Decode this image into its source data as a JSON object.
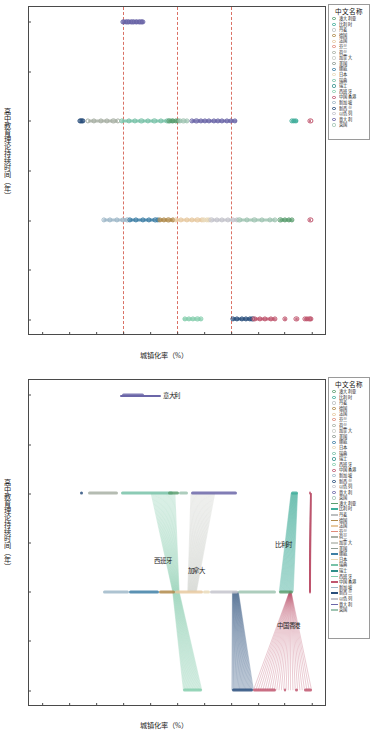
{
  "figure": {
    "caption": ""
  },
  "axes": {
    "xlabel": "城镇化率（%）",
    "ylabel": "高中教育理论持续时间（年）",
    "xticks": [
      "50.0",
      "55.0",
      "60.0",
      "65.0",
      "70.0",
      "75.0",
      "80.0",
      "85.0",
      "90.0",
      "95.0",
      "100.0"
    ],
    "yticks": [
      "2.0",
      "2.5",
      "3.0",
      "3.5",
      "4.0",
      "4.5",
      "5.0"
    ],
    "xlim": [
      47.5,
      102.5
    ],
    "ylim": [
      1.85,
      5.15
    ],
    "reference_lines_x": [
      65.0,
      75.0,
      85.0
    ],
    "reference_line_color": "#d4594b"
  },
  "legend": {
    "title": "中文名称",
    "countries": [
      {
        "label": "澳大利亚",
        "color": "#5a9e6f"
      },
      {
        "label": "比利时",
        "color": "#3fae9b"
      },
      {
        "label": "丹麦",
        "color": "#bcbfc1"
      },
      {
        "label": "德国",
        "color": "#b08a4a"
      },
      {
        "label": "法国",
        "color": "#e7c9a0"
      },
      {
        "label": "芬兰",
        "color": "#e08b7a"
      },
      {
        "label": "荷兰",
        "color": "#a8b0a4"
      },
      {
        "label": "加拿大",
        "color": "#c9ccc6"
      },
      {
        "label": "美国",
        "color": "#8f9b93"
      },
      {
        "label": "挪威",
        "color": "#3e7fa6"
      },
      {
        "label": "日本",
        "color": "#e9d9b8"
      },
      {
        "label": "瑞典",
        "color": "#78c2a8"
      },
      {
        "label": "瑞士",
        "color": "#2f8f8a"
      },
      {
        "label": "西班牙",
        "color": "#86cfae"
      },
      {
        "label": "中国香港",
        "color": "#c0566e"
      },
      {
        "label": "新加坡",
        "color": "#9fb8c9"
      },
      {
        "label": "新西兰",
        "color": "#2a4f7c"
      },
      {
        "label": "以色列",
        "color": "#c4c4cc"
      },
      {
        "label": "意大利",
        "color": "#6b66a8"
      },
      {
        "label": "英国",
        "color": "#9fc4b2"
      }
    ]
  },
  "chart_top": {
    "type": "scatter",
    "title": "",
    "series": [
      {
        "name": "意大利",
        "color": "#6b66a8",
        "y": 5.0,
        "x_start": 64.8,
        "x_end": 68.8,
        "points": [
          64.9,
          65.2,
          65.5,
          65.8,
          66.1,
          66.4,
          66.7,
          67.0,
          67.3,
          67.6,
          67.9,
          68.2,
          68.5,
          68.7
        ]
      },
      {
        "name": "新西兰",
        "color": "#2a4f7c",
        "y": 4.0,
        "x_start": 56.9,
        "x_end": 57.6,
        "points": [
          56.9,
          57.1,
          57.3,
          57.5
        ]
      },
      {
        "name": "荷兰",
        "color": "#a8b0a4",
        "y": 4.0,
        "x_start": 58.4,
        "x_end": 64.0,
        "points": [
          58.5,
          59.6,
          60.8,
          62.0,
          63.2,
          64.0
        ]
      },
      {
        "name": "瑞典",
        "color": "#78c2a8",
        "y": 4.0,
        "x_start": 64.6,
        "x_end": 74.2,
        "points": [
          64.8,
          66.0,
          67.2,
          68.4,
          69.6,
          70.8,
          72.0,
          73.2,
          74.0
        ]
      },
      {
        "name": "澳大利亚",
        "color": "#5a9e6f",
        "y": 4.0,
        "x_start": 73.4,
        "x_end": 75.4,
        "points": [
          73.6,
          74.2,
          74.8,
          75.2
        ]
      },
      {
        "name": "英国",
        "color": "#9fc4b2",
        "y": 4.0,
        "x_start": 75.4,
        "x_end": 77.0,
        "points": [
          75.6,
          76.2,
          76.8
        ]
      },
      {
        "name": "意大利",
        "color": "#6b66a8",
        "y": 4.0,
        "x_start": 77.6,
        "x_end": 86.2,
        "points": [
          77.8,
          78.6,
          79.4,
          80.2,
          81.0,
          81.8,
          82.6,
          83.4,
          84.2,
          85.0,
          85.8
        ]
      },
      {
        "name": "比利时",
        "color": "#3fae9b",
        "y": 4.0,
        "x_start": 96.2,
        "x_end": 97.4,
        "points": [
          96.3,
          96.7,
          97.1
        ]
      },
      {
        "name": "中国香港",
        "color": "#c0566e",
        "y": 4.0,
        "x_start": 99.6,
        "x_end": 99.9,
        "points": [
          99.8
        ]
      },
      {
        "name": "新加坡",
        "color": "#9fb8c9",
        "y": 3.0,
        "x_start": 61.2,
        "x_end": 66.0,
        "points": [
          61.4,
          62.6,
          63.8,
          65.0,
          65.8
        ]
      },
      {
        "name": "挪威",
        "color": "#3e7fa6",
        "y": 3.0,
        "x_start": 66.0,
        "x_end": 71.6,
        "points": [
          66.2,
          67.4,
          68.6,
          69.8,
          71.0,
          71.4
        ]
      },
      {
        "name": "德国",
        "color": "#b08a4a",
        "y": 3.0,
        "x_start": 71.6,
        "x_end": 74.6,
        "points": [
          71.8,
          72.6,
          73.4,
          74.2
        ]
      },
      {
        "name": "法国",
        "color": "#e7c9a0",
        "y": 3.0,
        "x_start": 74.6,
        "x_end": 79.8,
        "points": [
          74.8,
          75.8,
          76.8,
          77.8,
          78.8,
          79.6
        ]
      },
      {
        "name": "日本",
        "color": "#e9d9b8",
        "y": 3.0,
        "x_start": 79.8,
        "x_end": 81.2,
        "points": [
          80.0,
          80.6,
          81.0
        ]
      },
      {
        "name": "以色列",
        "color": "#c4c4cc",
        "y": 3.0,
        "x_start": 81.2,
        "x_end": 86.4,
        "points": [
          81.4,
          82.4,
          83.4,
          84.4,
          85.4,
          86.2
        ]
      },
      {
        "name": "英国",
        "color": "#9fc4b2",
        "y": 3.0,
        "x_start": 86.4,
        "x_end": 93.4,
        "points": [
          86.6,
          88.0,
          89.4,
          90.8,
          92.2,
          93.2
        ]
      },
      {
        "name": "澳大利亚",
        "color": "#5a9e6f",
        "y": 3.0,
        "x_start": 94.0,
        "x_end": 96.6,
        "points": [
          94.2,
          95.0,
          95.8,
          96.4
        ]
      },
      {
        "name": "中国香港",
        "color": "#c0566e",
        "y": 3.0,
        "x_start": 99.5,
        "x_end": 99.9,
        "points": [
          99.8
        ]
      },
      {
        "name": "西班牙",
        "color": "#86cfae",
        "y": 2.0,
        "x_start": 76.2,
        "x_end": 79.6,
        "points": [
          76.4,
          77.2,
          78.0,
          78.8,
          79.4
        ]
      },
      {
        "name": "新西兰",
        "color": "#2a4f7c",
        "y": 2.0,
        "x_start": 85.2,
        "x_end": 89.2,
        "points": [
          85.4,
          86.2,
          87.0,
          87.8,
          88.6,
          89.0
        ]
      },
      {
        "name": "中国香港",
        "color": "#c0566e",
        "y": 2.0,
        "x_start": 89.2,
        "x_end": 93.4,
        "points": [
          89.4,
          90.4,
          91.4,
          92.4,
          93.2
        ]
      },
      {
        "name": "中国香港",
        "color": "#c0566e",
        "y": 2.0,
        "x_start": 94.8,
        "x_end": 95.2,
        "points": [
          95.0
        ]
      },
      {
        "name": "中国香港",
        "color": "#c0566e",
        "y": 2.0,
        "x_start": 97.0,
        "x_end": 97.4,
        "points": [
          97.2
        ]
      },
      {
        "name": "中国香港",
        "color": "#c0566e",
        "y": 2.0,
        "x_start": 98.6,
        "x_end": 100.0,
        "points": [
          98.8,
          99.2,
          99.6,
          99.9
        ]
      }
    ]
  },
  "chart_bottom": {
    "type": "line",
    "title": "",
    "annotations": [
      {
        "label": "意大利",
        "x": 72.0,
        "y": 5.0,
        "color": "#6b66a8",
        "swatch": true
      },
      {
        "label": "西班牙",
        "x": 70.4,
        "y": 3.32,
        "color": "#86cfae",
        "swatch": false
      },
      {
        "label": "加拿大",
        "x": 76.6,
        "y": 3.22,
        "color": "#c9ccc6",
        "swatch": false
      },
      {
        "label": "比利时",
        "x": 92.8,
        "y": 3.48,
        "color": "#3fae9b",
        "swatch": false
      },
      {
        "label": "中国香港",
        "x": 93.2,
        "y": 2.66,
        "color": "#c0566e",
        "swatch": false
      }
    ],
    "flows": [
      {
        "name": "西班牙",
        "color": "#86cfae",
        "from_y": 4.0,
        "to_y": 3.0,
        "from_x": [
          70.2,
          74.6
        ],
        "to_x": [
          74.2,
          75.4
        ]
      },
      {
        "name": "西班牙",
        "color": "#86cfae",
        "from_y": 3.0,
        "to_y": 2.0,
        "from_x": [
          74.2,
          75.4
        ],
        "to_x": [
          76.2,
          79.6
        ]
      },
      {
        "name": "加拿大",
        "color": "#c9ccc6",
        "from_y": 4.0,
        "to_y": 3.0,
        "from_x": [
          77.6,
          82.0
        ],
        "to_x": [
          77.0,
          78.6
        ]
      },
      {
        "name": "比利时",
        "color": "#3fae9b",
        "from_y": 4.0,
        "to_y": 3.0,
        "from_x": [
          96.2,
          97.4
        ],
        "to_x": [
          94.0,
          96.6
        ]
      },
      {
        "name": "新西兰",
        "color": "#2a4f7c",
        "from_y": 3.0,
        "to_y": 2.0,
        "from_x": [
          85.3,
          86.4
        ],
        "to_x": [
          85.2,
          89.2
        ]
      },
      {
        "name": "中国香港",
        "color": "#c0566e",
        "from_y": 4.0,
        "to_y": 3.0,
        "from_x": [
          99.8,
          99.9
        ],
        "to_x": [
          99.6,
          99.8
        ]
      },
      {
        "name": "中国香港",
        "color": "#c0566e",
        "from_y": 3.0,
        "to_y": 2.0,
        "from_x": [
          95.9,
          96.2
        ],
        "to_x": [
          89.2,
          100.0
        ]
      }
    ]
  }
}
